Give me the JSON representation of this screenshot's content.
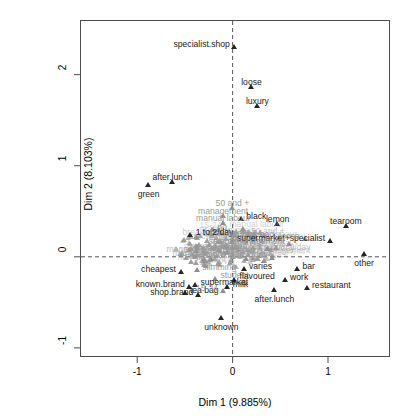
{
  "figure": {
    "kind": "mca-factor-map",
    "bg": "#ffffff",
    "frame_color": "#4d4d4d",
    "point_color": "#262626",
    "faded_color": "#8e8e8e",
    "guide_style": "dashed"
  },
  "axes": {
    "x_title": "Dim 1 (9.885%)",
    "y_title": "Dim 2 (8.103%)",
    "x_ticks": [
      "-1",
      "0",
      "1"
    ],
    "x_tick_values": [
      -1,
      0,
      1
    ],
    "y_ticks": [
      "-1",
      "0",
      "1",
      "2"
    ],
    "y_tick_values": [
      -1,
      0,
      1,
      2
    ],
    "xlim": [
      -1.6,
      1.65
    ],
    "ylim": [
      -1.1,
      2.6
    ],
    "grid": false,
    "guides": {
      "vertical_at": 0,
      "horizontal_at": 0
    }
  },
  "chart_data": {
    "type": "scatter",
    "title": "",
    "xlabel": "Dim 1 (9.885%)",
    "ylabel": "Dim 2 (8.103%)",
    "xlim": [
      -1.6,
      1.65
    ],
    "ylim": [
      -1.1,
      2.6
    ],
    "grid": false,
    "legend": "none",
    "marker": "triangle",
    "points": [
      {
        "label": "specialist.shop",
        "x": 0.02,
        "y": 2.27,
        "anchor": "left",
        "emphasis": "dark"
      },
      {
        "label": "loose",
        "x": 0.2,
        "y": 1.83,
        "anchor": "above",
        "emphasis": "dark"
      },
      {
        "label": "luxury",
        "x": 0.26,
        "y": 1.62,
        "anchor": "above",
        "emphasis": "dark"
      },
      {
        "label": "after.lunch",
        "x": -0.63,
        "y": 0.79,
        "anchor": "above",
        "emphasis": "dark"
      },
      {
        "label": "green",
        "x": -0.88,
        "y": 0.76,
        "anchor": "below",
        "emphasis": "dark"
      },
      {
        "label": "50 and +",
        "x": 0.0,
        "y": 0.5,
        "anchor": "above",
        "emphasis": "gray"
      },
      {
        "label": "management",
        "x": -0.1,
        "y": 0.42,
        "anchor": "above",
        "emphasis": "gray"
      },
      {
        "label": "black",
        "x": 0.09,
        "y": 0.38,
        "anchor": "right",
        "emphasis": "dark"
      },
      {
        "label": "lemon",
        "x": 0.47,
        "y": 0.33,
        "anchor": "above",
        "emphasis": "dark"
      },
      {
        "label": "tearoom",
        "x": 1.19,
        "y": 0.31,
        "anchor": "above",
        "emphasis": "dark"
      },
      {
        "label": "manual labour",
        "x": -0.1,
        "y": 0.34,
        "anchor": "above",
        "emphasis": "gray"
      },
      {
        "label": "no",
        "x": -0.21,
        "y": 0.26,
        "anchor": "right",
        "emphasis": "gray"
      },
      {
        "label": "1 to 2/day",
        "x": -0.44,
        "y": 0.21,
        "anchor": "right",
        "emphasis": "dark"
      },
      {
        "label": "tea bag",
        "x": 0.49,
        "y": 0.18,
        "anchor": "left",
        "emphasis": "gray"
      },
      {
        "label": "supermarket+specialist",
        "x": 1.02,
        "y": 0.14,
        "anchor": "left",
        "emphasis": "dark"
      },
      {
        "label": "senior management",
        "x": 0.6,
        "y": 0.11,
        "anchor": "left",
        "emphasis": "gray"
      },
      {
        "label": "orient",
        "x": 0.23,
        "y": 0.2,
        "anchor": "left",
        "emphasis": "gray"
      },
      {
        "label": "loose",
        "x": 0.76,
        "y": 0.16,
        "anchor": "left",
        "emphasis": "gray"
      },
      {
        "label": "lemon tea",
        "x": 0.36,
        "y": 0.05,
        "anchor": "left",
        "emphasis": "gray"
      },
      {
        "label": "wage",
        "x": -0.38,
        "y": 0.03,
        "anchor": "right",
        "emphasis": "gray"
      },
      {
        "label": "other",
        "x": 1.38,
        "y": 0.0,
        "anchor": "below",
        "emphasis": "dark"
      },
      {
        "label": "more than 2/day",
        "x": 0.42,
        "y": -0.04,
        "anchor": "left",
        "emphasis": "gray"
      },
      {
        "label": "breakfast",
        "x": 0.14,
        "y": -0.05,
        "anchor": "left",
        "emphasis": "gray"
      },
      {
        "label": "sugar",
        "x": -0.22,
        "y": -0.06,
        "anchor": "left",
        "emphasis": "gray"
      },
      {
        "label": "cheapest",
        "x": -0.54,
        "y": -0.2,
        "anchor": "left",
        "emphasis": "dark"
      },
      {
        "label": "slimming",
        "x": -0.37,
        "y": -0.18,
        "anchor": "right",
        "emphasis": "gray"
      },
      {
        "label": "varies",
        "x": 0.12,
        "y": -0.17,
        "anchor": "right",
        "emphasis": "dark"
      },
      {
        "label": "bar",
        "x": 0.68,
        "y": -0.17,
        "anchor": "right",
        "emphasis": "dark"
      },
      {
        "label": "student",
        "x": -0.18,
        "y": -0.27,
        "anchor": "right",
        "emphasis": "gray"
      },
      {
        "label": "flavoured",
        "x": 0.02,
        "y": -0.28,
        "anchor": "right",
        "emphasis": "dark"
      },
      {
        "label": "work",
        "x": 0.55,
        "y": -0.29,
        "anchor": "right",
        "emphasis": "dark"
      },
      {
        "label": "known.brand",
        "x": -0.45,
        "y": -0.36,
        "anchor": "left",
        "emphasis": "dark"
      },
      {
        "label": "supermarket",
        "x": -0.39,
        "y": -0.34,
        "anchor": "right",
        "emphasis": "dark"
      },
      {
        "label": "milk",
        "x": -0.05,
        "y": -0.36,
        "anchor": "right",
        "emphasis": "dark"
      },
      {
        "label": "restaurant",
        "x": 0.78,
        "y": -0.37,
        "anchor": "right",
        "emphasis": "dark"
      },
      {
        "label": "tea bag",
        "x": -0.5,
        "y": -0.43,
        "anchor": "right",
        "emphasis": "dark"
      },
      {
        "label": "15-24",
        "x": -0.1,
        "y": -0.41,
        "anchor": "left",
        "emphasis": "gray"
      },
      {
        "label": "after.lunch",
        "x": 0.44,
        "y": -0.4,
        "anchor": "below",
        "emphasis": "dark"
      },
      {
        "label": "shop.brand",
        "x": -0.36,
        "y": -0.45,
        "anchor": "left",
        "emphasis": "dark"
      },
      {
        "label": "unknown",
        "x": -0.12,
        "y": -0.7,
        "anchor": "below",
        "emphasis": "dark"
      }
    ],
    "cluster": {
      "center": [
        -0.05,
        0.07
      ],
      "radius_x": 0.55,
      "radius_y": 0.22,
      "approx_point_count": 150,
      "labels": [
        "management",
        "manual labour",
        "50 and +",
        "no",
        "1 to 2/day",
        "wage",
        "sugar",
        "breakfast",
        "tea bag",
        "orient",
        "lemon tea",
        "senior management",
        "more than 2/day",
        "student",
        "slimming",
        "15-24"
      ]
    }
  }
}
